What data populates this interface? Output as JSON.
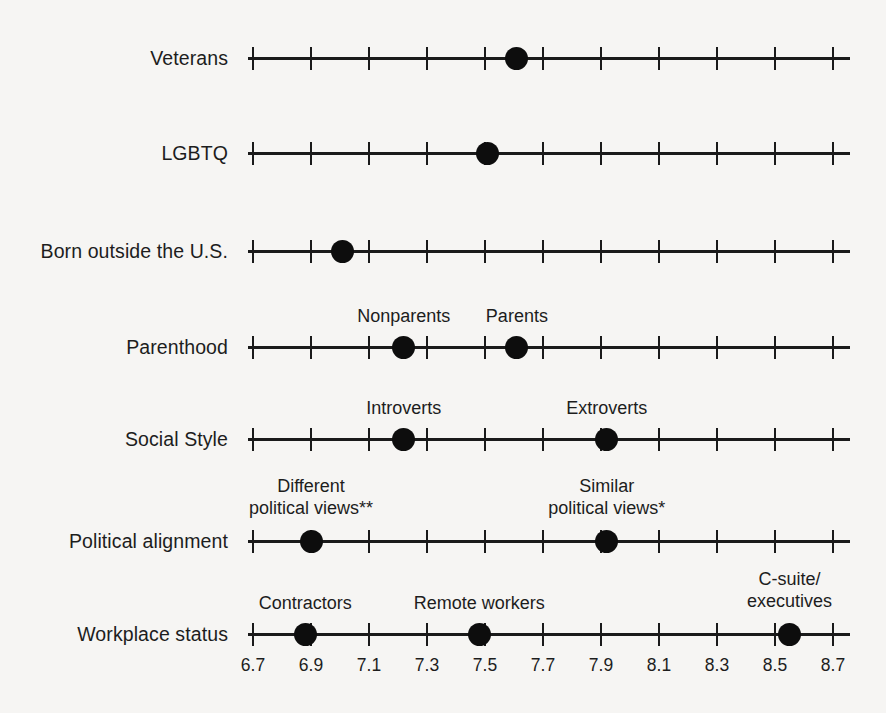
{
  "chart_data": {
    "type": "scatter",
    "title": "",
    "subtitle": "",
    "xlabel": "",
    "ylabel": "",
    "xlim": [
      6.7,
      8.7
    ],
    "xticks": [
      6.7,
      6.9,
      7.1,
      7.3,
      7.5,
      7.7,
      7.9,
      8.1,
      8.3,
      8.5,
      8.7
    ],
    "xtick_labels": [
      "6.7",
      "6.9",
      "7.1",
      "7.3",
      "7.5",
      "7.7",
      "7.9",
      "8.1",
      "8.3",
      "8.5",
      "8.7"
    ],
    "grid": false,
    "legend": "none",
    "categories": [
      "Veterans",
      "LGBTQ",
      "Born outside the U.S.",
      "Parenthood",
      "Social Style",
      "Political alignment",
      "Workplace status"
    ],
    "rows": [
      {
        "category": "Veterans",
        "y_px": 58,
        "points": [
          {
            "label": "",
            "label_line2": "",
            "value": 7.61,
            "show_label": false
          }
        ]
      },
      {
        "category": "LGBTQ",
        "y_px": 153,
        "points": [
          {
            "label": "",
            "label_line2": "",
            "value": 7.51,
            "show_label": false
          }
        ]
      },
      {
        "category": "Born outside the U.S.",
        "y_px": 251,
        "points": [
          {
            "label": "",
            "label_line2": "",
            "value": 7.01,
            "show_label": false
          }
        ]
      },
      {
        "category": "Parenthood",
        "y_px": 347,
        "points": [
          {
            "label": "Nonparents",
            "label_line2": "",
            "value": 7.22,
            "show_label": true
          },
          {
            "label": "Parents",
            "label_line2": "",
            "value": 7.61,
            "show_label": true
          }
        ]
      },
      {
        "category": "Social Style",
        "y_px": 439,
        "points": [
          {
            "label": "Introverts",
            "label_line2": "",
            "value": 7.22,
            "show_label": true
          },
          {
            "label": "Extroverts",
            "label_line2": "",
            "value": 7.92,
            "show_label": true
          }
        ]
      },
      {
        "category": "Political alignment",
        "y_px": 541,
        "points": [
          {
            "label": "Different",
            "label_line2": "political views**",
            "value": 6.9,
            "show_label": true
          },
          {
            "label": "Similar",
            "label_line2": "political views*",
            "value": 7.92,
            "show_label": true
          }
        ]
      },
      {
        "category": "Workplace status",
        "y_px": 634,
        "points": [
          {
            "label": "Contractors",
            "label_line2": "",
            "value": 6.88,
            "show_label": true
          },
          {
            "label": "Remote workers",
            "label_line2": "",
            "value": 7.48,
            "show_label": true
          },
          {
            "label": "C-suite/",
            "label_line2": "executives",
            "value": 8.55,
            "show_label": true
          }
        ]
      }
    ],
    "colors": {
      "background": "#f6f5f3",
      "axis": "#1a1a1a",
      "marker": "#0d0d0d",
      "text": "#1d1d1d"
    }
  },
  "layout": {
    "axis_left_px": 248,
    "axis_right_px": 850,
    "tick_first_px": 253,
    "tick_spacing_px": 58
  }
}
